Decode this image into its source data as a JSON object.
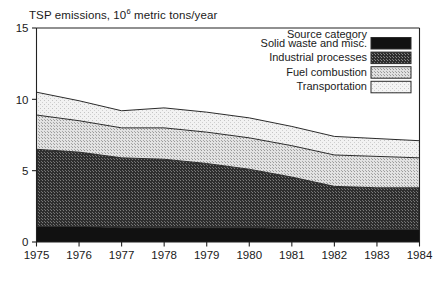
{
  "chart_data": {
    "type": "area",
    "title_main": "TSP emissions, 10",
    "title_sup": "6",
    "title_tail": " metric tons/year",
    "xlabel": "",
    "ylabel": "",
    "stacked": true,
    "grid": false,
    "legend_position": "top-right",
    "legend_title": "Source category",
    "x": [
      1975,
      1976,
      1977,
      1978,
      1979,
      1980,
      1981,
      1982,
      1983,
      1984
    ],
    "categories": [
      "1975",
      "1976",
      "1977",
      "1978",
      "1979",
      "1980",
      "1981",
      "1982",
      "1983",
      "1984"
    ],
    "xlim": [
      1975,
      1984
    ],
    "ylim": [
      0,
      15
    ],
    "yticks": [
      0,
      5,
      10,
      15
    ],
    "ytick_labels": [
      "0",
      "5",
      "10",
      "15"
    ],
    "series": [
      {
        "name": "Solid waste and misc.",
        "order": 1,
        "fill": "#111111",
        "pattern": "solid",
        "values": [
          1.1,
          1.1,
          1.0,
          1.0,
          1.0,
          1.0,
          0.95,
          0.9,
          0.9,
          0.9
        ]
      },
      {
        "name": "Industrial processes",
        "order": 2,
        "fill": "#4a4a4a",
        "pattern": "dense-dots",
        "values": [
          5.4,
          5.2,
          4.9,
          4.8,
          4.5,
          4.1,
          3.6,
          3.0,
          2.9,
          2.9
        ]
      },
      {
        "name": "Fuel combustion",
        "order": 3,
        "fill": "#d2d2d2",
        "pattern": "light-dots",
        "values": [
          2.4,
          2.2,
          2.1,
          2.2,
          2.2,
          2.2,
          2.2,
          2.2,
          2.2,
          2.1
        ]
      },
      {
        "name": "Transportation",
        "order": 4,
        "fill": "#efefef",
        "pattern": "faint-dots",
        "values": [
          1.6,
          1.4,
          1.2,
          1.4,
          1.4,
          1.4,
          1.35,
          1.3,
          1.25,
          1.2
        ]
      }
    ],
    "totals": [
      10.5,
      9.9,
      9.2,
      9.4,
      9.1,
      8.7,
      8.1,
      7.4,
      7.25,
      7.1
    ]
  },
  "legend": {
    "title": "Source category",
    "items": [
      {
        "label": "Solid waste and misc.",
        "color": "#111111"
      },
      {
        "label": "Industrial processes",
        "color": "#4a4a4a"
      },
      {
        "label": "Fuel combustion",
        "color": "#d2d2d2"
      },
      {
        "label": "Transportation",
        "color": "#efefef"
      }
    ]
  },
  "colors": {
    "axis": "#222222",
    "text": "#1a1a1a",
    "background": "#ffffff"
  }
}
